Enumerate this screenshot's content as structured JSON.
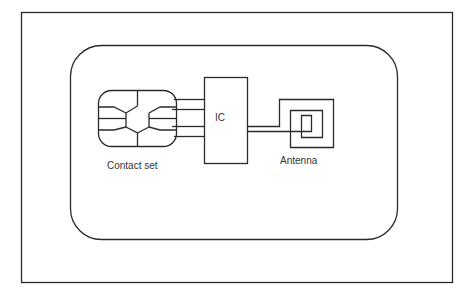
{
  "diagram": {
    "type": "smart-card-architecture",
    "components": [
      {
        "id": "card",
        "label": "",
        "shape": "rounded-rectangle"
      },
      {
        "id": "contact_set",
        "label": "Contact set",
        "shape": "contact-chip"
      },
      {
        "id": "ic",
        "label": "IC",
        "shape": "rectangle"
      },
      {
        "id": "antenna",
        "label": "Antenna",
        "shape": "square-coil"
      }
    ],
    "connections": [
      {
        "from": "contact_set",
        "to": "ic",
        "wires": 4
      },
      {
        "from": "ic",
        "to": "antenna",
        "wires": 2
      }
    ],
    "labels": {
      "contact_set": "Contact set",
      "ic": "IC",
      "antenna": "Antenna"
    },
    "colors": {
      "line": "#2b2b2b",
      "text": "#333333",
      "background": "#ffffff"
    }
  }
}
